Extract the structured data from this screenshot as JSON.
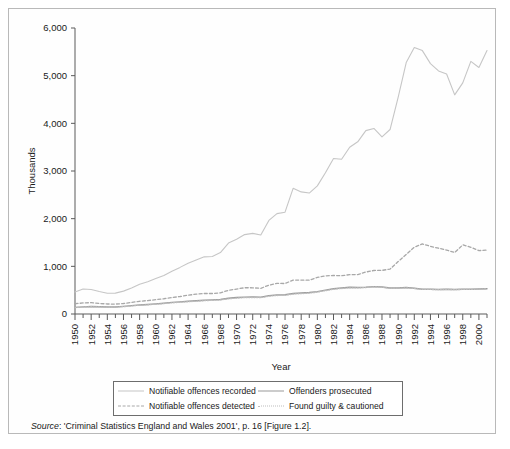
{
  "figure": {
    "source_label": "Source",
    "source_text": ": 'Criminal Statistics England and Wales 2001', p. 16 [Figure 1.2]."
  },
  "legend": {
    "items": [
      {
        "label": "Notifiable offences recorded",
        "style": "solid-light",
        "color": "#c6c6c6"
      },
      {
        "label": "Offenders prosecuted",
        "style": "solid-dark",
        "color": "#9a9a9a"
      },
      {
        "label": "Notifiable offences detected",
        "style": "dashed",
        "color": "#a8a8a8"
      },
      {
        "label": "Found guilty & cautioned",
        "style": "dotted",
        "color": "#bdbdbd"
      }
    ]
  },
  "chart_data": {
    "type": "line",
    "title": "",
    "xlabel": "Year",
    "ylabel": "Thousands",
    "xlim": [
      1950,
      2001
    ],
    "ylim": [
      0,
      6000
    ],
    "grid": false,
    "legend_position": "bottom",
    "ytick_labels": [
      "0",
      "1,000",
      "2,000",
      "3,000",
      "4,000",
      "5,000",
      "6,000"
    ],
    "ytick_values": [
      0,
      1000,
      2000,
      3000,
      4000,
      5000,
      6000
    ],
    "xtick_labels": [
      "1950",
      "1952",
      "1954",
      "1956",
      "1958",
      "1960",
      "1962",
      "1964",
      "1966",
      "1968",
      "1970",
      "1972",
      "1974",
      "1976",
      "1978",
      "1980",
      "1982",
      "1984",
      "1986",
      "1988",
      "1990",
      "1992",
      "1994",
      "1996",
      "1998",
      "2000"
    ],
    "xtick_values": [
      1950,
      1952,
      1954,
      1956,
      1958,
      1960,
      1962,
      1964,
      1966,
      1968,
      1970,
      1972,
      1974,
      1976,
      1978,
      1980,
      1982,
      1984,
      1986,
      1988,
      1990,
      1992,
      1994,
      1996,
      1998,
      2000
    ],
    "x": [
      1950,
      1951,
      1952,
      1953,
      1954,
      1955,
      1956,
      1957,
      1958,
      1959,
      1960,
      1961,
      1962,
      1963,
      1964,
      1965,
      1966,
      1967,
      1968,
      1969,
      1970,
      1971,
      1972,
      1973,
      1974,
      1975,
      1976,
      1977,
      1978,
      1979,
      1980,
      1981,
      1982,
      1983,
      1984,
      1985,
      1986,
      1987,
      1988,
      1989,
      1990,
      1991,
      1992,
      1993,
      1994,
      1995,
      1996,
      1997,
      1998,
      1999,
      2000,
      2001
    ],
    "series": [
      {
        "name": "Notifiable offences recorded",
        "style": "solid-light",
        "color": "#c6c6c6",
        "values": [
          461,
          525,
          514,
          471,
          435,
          438,
          480,
          546,
          626,
          675,
          743,
          807,
          896,
          978,
          1067,
          1133,
          1199,
          1207,
          1289,
          1488,
          1568,
          1666,
          1691,
          1658,
          1963,
          2106,
          2136,
          2636,
          2562,
          2537,
          2688,
          2964,
          3262,
          3247,
          3499,
          3612,
          3847,
          3892,
          3716,
          3870,
          4544,
          5276,
          5592,
          5526,
          5253,
          5100,
          5036,
          4598,
          4850,
          5301,
          5171,
          5527
        ]
      },
      {
        "name": "Notifiable offences detected",
        "style": "dashed",
        "color": "#a8a8a8",
        "values": [
          215,
          232,
          238,
          222,
          210,
          208,
          220,
          243,
          267,
          282,
          300,
          320,
          344,
          367,
          394,
          416,
          430,
          430,
          443,
          497,
          524,
          551,
          550,
          538,
          605,
          643,
          639,
          712,
          711,
          710,
          768,
          800,
          808,
          804,
          825,
          828,
          880,
          913,
          915,
          943,
          1100,
          1249,
          1400,
          1470,
          1420,
          1380,
          1340,
          1290,
          1450,
          1400,
          1330,
          1340
        ]
      },
      {
        "name": "Offenders prosecuted",
        "style": "solid-dark",
        "color": "#9a9a9a",
        "values": [
          140,
          150,
          157,
          152,
          146,
          148,
          160,
          175,
          190,
          200,
          212,
          226,
          243,
          255,
          268,
          278,
          290,
          296,
          305,
          330,
          345,
          355,
          358,
          355,
          385,
          400,
          405,
          430,
          440,
          450,
          470,
          500,
          530,
          545,
          560,
          555,
          560,
          575,
          565,
          545,
          545,
          555,
          540,
          520,
          520,
          515,
          520,
          515,
          520,
          520,
          525,
          530
        ]
      },
      {
        "name": "Found guilty & cautioned",
        "style": "dotted",
        "color": "#bdbdbd",
        "values": [
          135,
          145,
          152,
          147,
          141,
          143,
          154,
          169,
          183,
          193,
          205,
          218,
          234,
          246,
          258,
          268,
          280,
          286,
          295,
          318,
          333,
          343,
          346,
          343,
          373,
          388,
          393,
          418,
          428,
          438,
          458,
          490,
          520,
          535,
          550,
          548,
          555,
          570,
          560,
          540,
          540,
          548,
          535,
          515,
          515,
          512,
          516,
          512,
          516,
          517,
          522,
          526
        ]
      }
    ]
  }
}
